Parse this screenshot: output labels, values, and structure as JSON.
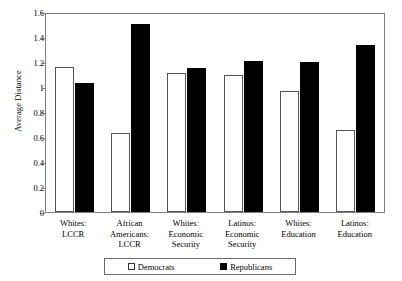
{
  "chart_data": {
    "type": "bar",
    "title": "",
    "xlabel": "",
    "ylabel": "Average Distance",
    "ylim": [
      0,
      1.6
    ],
    "yticks": [
      0,
      0.2,
      0.4,
      0.6,
      0.8,
      1,
      1.2,
      1.4,
      1.6
    ],
    "ytick_labels": [
      "0",
      "0.2",
      "0.4",
      "0.6",
      "0.8",
      "1",
      "1.2",
      "1.4",
      "1.6"
    ],
    "grid": false,
    "legend_position": "bottom",
    "categories": [
      "Whites: LCCR",
      "African Americans: LCCR",
      "Whites: Economic Security",
      "Latinos: Economic Security",
      "Whites: Education",
      "Latinos: Education"
    ],
    "category_lines": [
      [
        "Whites:",
        "LCCR"
      ],
      [
        "African",
        "Americans:",
        "LCCR"
      ],
      [
        "Whites:",
        "Economic",
        "Security"
      ],
      [
        "Latinos:",
        "Economic",
        "Security"
      ],
      [
        "Whites:",
        "Education"
      ],
      [
        "Latinos:",
        "Education"
      ]
    ],
    "series": [
      {
        "name": "Democrats",
        "color": "#ffffff",
        "values": [
          1.17,
          0.64,
          1.12,
          1.11,
          0.98,
          0.66
        ]
      },
      {
        "name": "Republicans",
        "color": "#000000",
        "values": [
          1.04,
          1.52,
          1.16,
          1.22,
          1.21,
          1.35
        ]
      }
    ]
  },
  "legend": {
    "items": [
      {
        "label": "Democrats",
        "style": "dem"
      },
      {
        "label": "Republicans",
        "style": "rep"
      }
    ]
  }
}
